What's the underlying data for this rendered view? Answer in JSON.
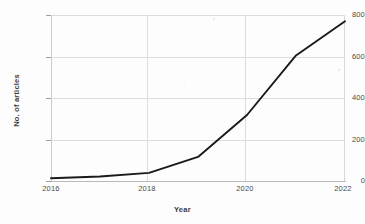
{
  "chart_data": {
    "type": "line",
    "title": "",
    "xlabel": "Year",
    "ylabel": "No. of articles",
    "x": [
      2016,
      2017,
      2018,
      2019,
      2020,
      2021,
      2022
    ],
    "values": [
      13,
      22,
      39,
      116,
      318,
      605,
      770
    ],
    "series": [
      {
        "name": "No. of articles",
        "values": [
          13,
          22,
          39,
          116,
          318,
          605,
          770
        ],
        "color": "#1a1a1a"
      }
    ],
    "xlim": [
      2016,
      2022
    ],
    "ylim": [
      0,
      800
    ],
    "xticks": [
      2016,
      2018,
      2020,
      2022
    ],
    "xtick_labels": [
      "2016",
      "2018",
      "2020",
      "2022"
    ],
    "yticks": [
      0,
      200,
      400,
      600,
      800
    ],
    "ytick_labels": [
      "0",
      "200",
      "400",
      "600",
      "800"
    ],
    "grid": true,
    "grid_color": "#dcdcdc",
    "legend": false,
    "legend_position": "none",
    "line_width": 1.9,
    "markers": false,
    "background_color": "#fdfdfd",
    "axis_color": "#c9c9c9",
    "text_color": "#3a3a3a"
  }
}
